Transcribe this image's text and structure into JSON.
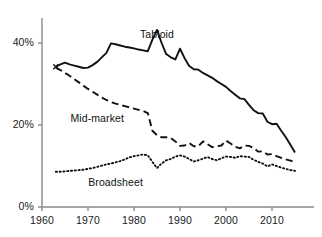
{
  "chart_data": {
    "type": "line",
    "title": "",
    "subtitle": "",
    "xlabel": "",
    "ylabel": "",
    "xlim": [
      1960,
      2016
    ],
    "ylim": [
      0,
      45
    ],
    "grid": false,
    "legend_position": "inline-annotations",
    "x_ticks": [
      1960,
      1970,
      1980,
      1990,
      2000,
      2010
    ],
    "x_tick_labels": [
      "1960",
      "1970",
      "1980",
      "1990",
      "2000",
      "2010"
    ],
    "y_ticks": [
      0,
      20,
      40
    ],
    "y_tick_labels": [
      "0%",
      "20%",
      "40%"
    ],
    "axis_color": "#8a8a8a",
    "series": [
      {
        "name": "Tabloid",
        "style": "solid",
        "color": "#111111",
        "label_x": 1985,
        "label_y": 42,
        "points": [
          [
            1963,
            34.2
          ],
          [
            1964,
            34.8
          ],
          [
            1965,
            35.2
          ],
          [
            1966,
            34.8
          ],
          [
            1967,
            34.5
          ],
          [
            1968,
            34.2
          ],
          [
            1969,
            33.9
          ],
          [
            1970,
            34.0
          ],
          [
            1971,
            34.6
          ],
          [
            1972,
            35.4
          ],
          [
            1973,
            36.5
          ],
          [
            1974,
            37.6
          ],
          [
            1975,
            39.9
          ],
          [
            1976,
            39.7
          ],
          [
            1977,
            39.4
          ],
          [
            1978,
            39.1
          ],
          [
            1979,
            38.9
          ],
          [
            1980,
            38.7
          ],
          [
            1981,
            38.4
          ],
          [
            1982,
            38.2
          ],
          [
            1983,
            38.0
          ],
          [
            1984,
            40.8
          ],
          [
            1985,
            43.2
          ],
          [
            1986,
            40.0
          ],
          [
            1987,
            37.3
          ],
          [
            1988,
            36.5
          ],
          [
            1989,
            36.0
          ],
          [
            1990,
            38.6
          ],
          [
            1991,
            36.3
          ],
          [
            1992,
            34.4
          ],
          [
            1993,
            33.6
          ],
          [
            1994,
            33.5
          ],
          [
            1995,
            32.7
          ],
          [
            1996,
            32.1
          ],
          [
            1997,
            31.5
          ],
          [
            1998,
            30.7
          ],
          [
            1999,
            30.0
          ],
          [
            2000,
            29.3
          ],
          [
            2001,
            28.3
          ],
          [
            2002,
            27.4
          ],
          [
            2003,
            26.5
          ],
          [
            2004,
            26.3
          ],
          [
            2005,
            24.9
          ],
          [
            2006,
            23.6
          ],
          [
            2007,
            22.9
          ],
          [
            2008,
            22.8
          ],
          [
            2009,
            20.8
          ],
          [
            2010,
            20.2
          ],
          [
            2011,
            20.3
          ],
          [
            2012,
            18.6
          ],
          [
            2013,
            17.0
          ],
          [
            2014,
            15.2
          ],
          [
            2015,
            13.3
          ]
        ]
      },
      {
        "name": "Mid-market",
        "style": "dashed",
        "color": "#111111",
        "label_x": 1972,
        "label_y": 21.5,
        "points": [
          [
            1963,
            34.0
          ],
          [
            1964,
            33.4
          ],
          [
            1965,
            32.7
          ],
          [
            1966,
            32.0
          ],
          [
            1967,
            31.2
          ],
          [
            1968,
            30.4
          ],
          [
            1969,
            29.6
          ],
          [
            1970,
            28.8
          ],
          [
            1971,
            28.1
          ],
          [
            1972,
            27.4
          ],
          [
            1973,
            26.7
          ],
          [
            1974,
            26.1
          ],
          [
            1975,
            25.6
          ],
          [
            1976,
            25.2
          ],
          [
            1977,
            24.9
          ],
          [
            1978,
            24.6
          ],
          [
            1979,
            24.3
          ],
          [
            1980,
            24.0
          ],
          [
            1981,
            23.7
          ],
          [
            1982,
            23.4
          ],
          [
            1983,
            22.9
          ],
          [
            1984,
            18.6
          ],
          [
            1985,
            17.5
          ],
          [
            1986,
            17.0
          ],
          [
            1987,
            17.0
          ],
          [
            1988,
            16.8
          ],
          [
            1989,
            16.0
          ],
          [
            1990,
            14.9
          ],
          [
            1991,
            15.0
          ],
          [
            1992,
            15.6
          ],
          [
            1993,
            14.8
          ],
          [
            1994,
            14.8
          ],
          [
            1995,
            16.0
          ],
          [
            1996,
            15.3
          ],
          [
            1997,
            14.6
          ],
          [
            1998,
            14.8
          ],
          [
            1999,
            15.0
          ],
          [
            2000,
            16.2
          ],
          [
            2001,
            15.5
          ],
          [
            2002,
            14.7
          ],
          [
            2003,
            14.3
          ],
          [
            2004,
            15.0
          ],
          [
            2005,
            14.9
          ],
          [
            2006,
            14.4
          ],
          [
            2007,
            13.5
          ],
          [
            2008,
            13.6
          ],
          [
            2009,
            12.8
          ],
          [
            2010,
            12.9
          ],
          [
            2011,
            12.4
          ],
          [
            2012,
            12.0
          ],
          [
            2013,
            11.6
          ],
          [
            2014,
            11.3
          ],
          [
            2015,
            11.0
          ]
        ]
      },
      {
        "name": "Broadsheet",
        "style": "dotted",
        "color": "#111111",
        "label_x": 1976,
        "label_y": 5.8,
        "points": [
          [
            1963,
            8.6
          ],
          [
            1964,
            8.6
          ],
          [
            1965,
            8.7
          ],
          [
            1966,
            8.8
          ],
          [
            1967,
            8.9
          ],
          [
            1968,
            9.0
          ],
          [
            1969,
            9.1
          ],
          [
            1970,
            9.3
          ],
          [
            1971,
            9.5
          ],
          [
            1972,
            9.8
          ],
          [
            1973,
            10.1
          ],
          [
            1974,
            10.4
          ],
          [
            1975,
            10.6
          ],
          [
            1976,
            10.9
          ],
          [
            1977,
            11.2
          ],
          [
            1978,
            11.6
          ],
          [
            1979,
            12.1
          ],
          [
            1980,
            12.4
          ],
          [
            1981,
            12.6
          ],
          [
            1982,
            12.8
          ],
          [
            1983,
            12.6
          ],
          [
            1984,
            11.0
          ],
          [
            1985,
            9.5
          ],
          [
            1986,
            10.6
          ],
          [
            1987,
            11.4
          ],
          [
            1988,
            11.7
          ],
          [
            1989,
            12.3
          ],
          [
            1990,
            12.6
          ],
          [
            1991,
            12.3
          ],
          [
            1992,
            11.7
          ],
          [
            1993,
            11.1
          ],
          [
            1994,
            11.4
          ],
          [
            1995,
            11.8
          ],
          [
            1996,
            12.2
          ],
          [
            1997,
            11.7
          ],
          [
            1998,
            11.4
          ],
          [
            1999,
            11.9
          ],
          [
            2000,
            12.3
          ],
          [
            2001,
            12.2
          ],
          [
            2002,
            12.0
          ],
          [
            2003,
            12.4
          ],
          [
            2004,
            12.3
          ],
          [
            2005,
            12.2
          ],
          [
            2006,
            11.5
          ],
          [
            2007,
            11.0
          ],
          [
            2008,
            10.6
          ],
          [
            2009,
            9.9
          ],
          [
            2010,
            10.4
          ],
          [
            2011,
            10.0
          ],
          [
            2012,
            9.6
          ],
          [
            2013,
            9.3
          ],
          [
            2014,
            9.0
          ],
          [
            2015,
            8.8
          ]
        ]
      }
    ]
  }
}
